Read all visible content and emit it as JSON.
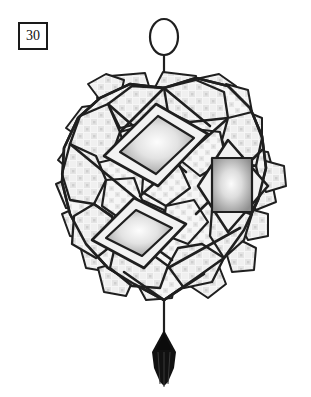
{
  "plate": {
    "figure_number": "30",
    "background_color": "#ffffff",
    "width": 311,
    "height": 397
  },
  "illustration": {
    "name": "mirror-work-hanging-ornament",
    "description": "Faceted patchwork hanging ornament with embedded mirrors, suspension loop and tassel",
    "colors": {
      "outline": "#1f1f1f",
      "patch_fill": "#f4f4f4",
      "weave_light": "#ededed",
      "weave_dark": "#d8d8d8",
      "mirror_edge": "#9a9a9a",
      "mirror_center": "#fdfdfd",
      "tassel": "#111111",
      "cord": "#1f1f1f"
    },
    "parts": {
      "loop_label": "suspension loop",
      "cord_label": "hanging cord",
      "body_label": "patchwork body",
      "tassel_label": "tassel"
    },
    "mirror_count": 3,
    "mirrors": [
      {
        "label": "upper-left mirror"
      },
      {
        "label": "right mirror"
      },
      {
        "label": "lower-left mirror"
      }
    ]
  }
}
